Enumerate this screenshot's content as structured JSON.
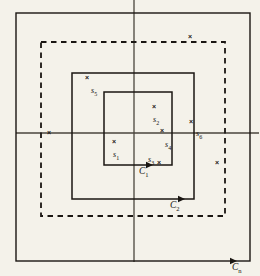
{
  "figure": {
    "type": "contour-diagram",
    "background_color": "#f4f2ea",
    "ink_color": "#1a1612",
    "frame": {
      "name": "outer-frame",
      "style": "solid",
      "x": 16,
      "y": 13,
      "width": 234,
      "height": 248
    },
    "axes": {
      "horizontal": {
        "label": "",
        "y": 133,
        "x1": 16,
        "x2": 258
      },
      "vertical": {
        "label": "",
        "x": 134,
        "y1": 0,
        "y2": 261
      }
    },
    "contours": [
      {
        "id": "C1",
        "label": "C",
        "sub": "1",
        "style": "solid",
        "x": 104,
        "y": 92,
        "width": 68,
        "height": 73,
        "label_x": 139,
        "label_y": 167,
        "arrow_x": 150,
        "arrow_y": 165
      },
      {
        "id": "C2",
        "label": "C",
        "sub": "2",
        "style": "solid",
        "x": 72,
        "y": 73,
        "width": 122,
        "height": 126,
        "label_x": 170,
        "label_y": 201,
        "arrow_x": 182,
        "arrow_y": 199
      },
      {
        "id": "Cn",
        "label": "C",
        "sub": "n",
        "style": "solid-outer-frame",
        "label_x": 232,
        "label_y": 263,
        "arrow_x": 237,
        "arrow_y": 261
      },
      {
        "id": "Cdashed",
        "label": "",
        "sub": "",
        "style": "dashed",
        "x": 41,
        "y": 42,
        "width": 184,
        "height": 174
      }
    ],
    "singularities": [
      {
        "name": "s1",
        "label": "s",
        "sub": "1",
        "mark_x": 115,
        "mark_y": 142,
        "label_x": 113,
        "label_y": 151
      },
      {
        "name": "s2",
        "label": "s",
        "sub": "2",
        "mark_x": 155,
        "mark_y": 107,
        "label_x": 153,
        "label_y": 116
      },
      {
        "name": "s3",
        "label": "s",
        "sub": "3",
        "mark_x": 160,
        "mark_y": 163,
        "label_x": 148,
        "label_y": 156
      },
      {
        "name": "s4",
        "label": "s",
        "sub": "4",
        "mark_x": 163,
        "mark_y": 131,
        "label_x": 165,
        "label_y": 141
      },
      {
        "name": "s5",
        "label": "s",
        "sub": "5",
        "mark_x": 88,
        "mark_y": 78,
        "label_x": 91,
        "label_y": 87
      },
      {
        "name": "s6",
        "label": "s",
        "sub": "6",
        "mark_x": 192,
        "mark_y": 122,
        "label_x": 196,
        "label_y": 130
      },
      {
        "name": "unlabeled-top",
        "label": "",
        "sub": "",
        "mark_x": 191,
        "mark_y": 37,
        "label_x": 0,
        "label_y": 0
      },
      {
        "name": "unlabeled-left",
        "label": "",
        "sub": "",
        "mark_x": 50,
        "mark_y": 133,
        "label_x": 0,
        "label_y": 0
      },
      {
        "name": "unlabeled-right",
        "label": "",
        "sub": "",
        "mark_x": 218,
        "mark_y": 163,
        "label_x": 0,
        "label_y": 0
      }
    ],
    "axis_labels": {
      "cn_label": "C",
      "cn_sub": "n"
    }
  }
}
